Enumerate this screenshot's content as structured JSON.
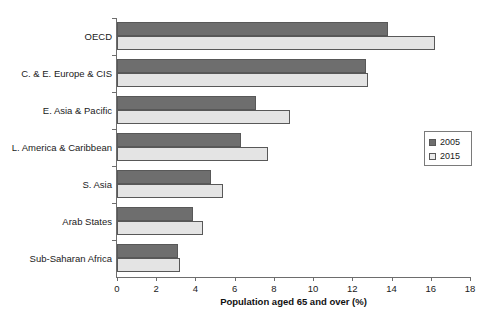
{
  "chart_data": {
    "type": "bar",
    "orientation": "horizontal",
    "title": "",
    "xlabel": "Population aged 65 and over (%)",
    "ylabel": "",
    "xlim": [
      0,
      18
    ],
    "xticks": [
      0,
      2,
      4,
      6,
      8,
      10,
      12,
      14,
      16,
      18
    ],
    "xtick_labels": [
      "0",
      "2",
      "4",
      "6",
      "8",
      "10",
      "12",
      "14",
      "16",
      "18"
    ],
    "grid": false,
    "legend_position": "right",
    "categories": [
      "OECD",
      "C. & E. Europe & CIS",
      "E. Asia & Pacific",
      "L. America & Caribbean",
      "S. Asia",
      "Arab States",
      "Sub-Saharan Africa"
    ],
    "series": [
      {
        "name": "2005",
        "color": "#6e6e6e",
        "values": [
          13.8,
          12.7,
          7.1,
          6.3,
          4.8,
          3.9,
          3.1
        ]
      },
      {
        "name": "2015",
        "color": "#e4e4e4",
        "values": [
          16.2,
          12.8,
          8.8,
          7.7,
          5.4,
          4.4,
          3.2
        ]
      }
    ]
  },
  "legend": {
    "items": [
      {
        "label": "2005",
        "swatch": "dark-swatch-icon"
      },
      {
        "label": "2015",
        "swatch": "light-swatch-icon"
      }
    ]
  }
}
